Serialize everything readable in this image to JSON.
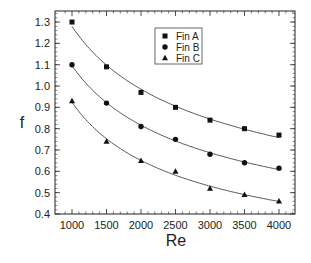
{
  "chart_data": {
    "type": "scatter",
    "title": "",
    "xlabel": "Re",
    "ylabel": "f",
    "xlim": [
      850,
      4250
    ],
    "ylim": [
      0.4,
      1.35
    ],
    "xticks": [
      1000,
      1500,
      2000,
      2500,
      3000,
      3500,
      4000
    ],
    "yticks": [
      0.4,
      0.5,
      0.6,
      0.7,
      0.8,
      0.9,
      1.0,
      1.1,
      1.2,
      1.3
    ],
    "xtick_labels": [
      "1000",
      "1500",
      "2000",
      "2500",
      "3000",
      "3500",
      "4000"
    ],
    "ytick_labels": [
      "0.4",
      "0.5",
      "0.6",
      "0.7",
      "0.8",
      "0.9",
      "1.0",
      "1.1",
      "1.2",
      "1.3"
    ],
    "grid": false,
    "legend_position": "top-center",
    "x": [
      1000,
      1500,
      2000,
      2500,
      3000,
      3500,
      4000
    ],
    "series": [
      {
        "name": "Fin A",
        "marker": "square",
        "values": [
          1.3,
          1.09,
          0.97,
          0.9,
          0.84,
          0.8,
          0.77
        ],
        "fit_curve": true
      },
      {
        "name": "Fin B",
        "marker": "circle",
        "values": [
          1.1,
          0.92,
          0.81,
          0.75,
          0.68,
          0.64,
          0.615
        ],
        "fit_curve": true
      },
      {
        "name": "Fin C",
        "marker": "triangle",
        "values": [
          0.93,
          0.74,
          0.65,
          0.6,
          0.52,
          0.49,
          0.46
        ],
        "fit_curve": true
      }
    ],
    "colors": {
      "marker": "#111111",
      "curve": "#555555",
      "axis": "#222222"
    }
  }
}
